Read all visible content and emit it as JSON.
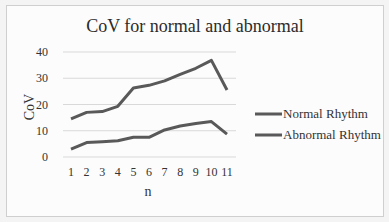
{
  "chart_data": {
    "type": "line",
    "title": "CoV for normal and abnormal",
    "xlabel": "n",
    "ylabel": "CoV",
    "x": [
      1,
      2,
      3,
      4,
      5,
      6,
      7,
      8,
      9,
      10,
      11
    ],
    "yticks": [
      0,
      10,
      20,
      30,
      40
    ],
    "ylim": [
      0,
      40
    ],
    "grid": true,
    "legend_position": "right",
    "series": [
      {
        "name": "Normal Rhythm",
        "values": [
          14.5,
          17,
          17.3,
          19.3,
          26.3,
          27.3,
          29,
          31.5,
          33.8,
          36.8,
          25.5
        ],
        "color": "#595959"
      },
      {
        "name": "Abnormal Rhythm",
        "values": [
          3,
          5.5,
          5.8,
          6.2,
          7.5,
          7.5,
          10.3,
          11.8,
          12.8,
          13.5,
          8.7
        ],
        "color": "#595959"
      }
    ]
  }
}
